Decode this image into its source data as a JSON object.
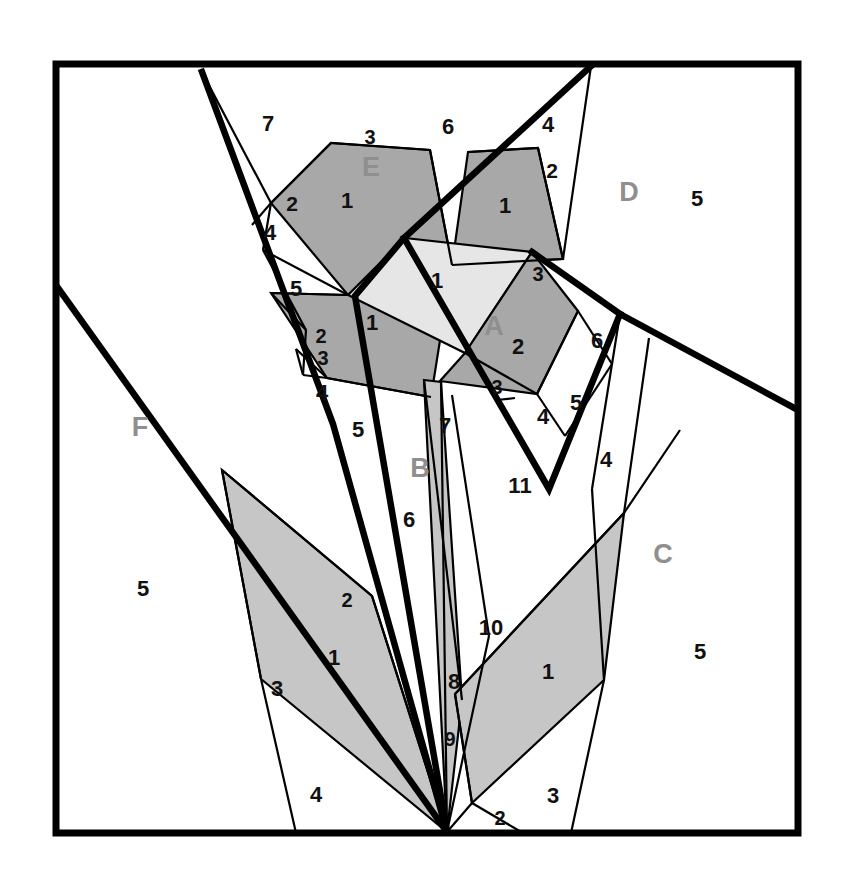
{
  "figure": {
    "frame": {
      "x": 56,
      "y": 64,
      "width": 742,
      "height": 769
    },
    "canvas": {
      "width": 845,
      "height": 878
    }
  },
  "colors": {
    "background": "#ffffff",
    "stroke": "#000000",
    "dark_gray": "#a8a8a8",
    "mid_gray": "#c6c6c6",
    "light_gray": "#e6e6e6",
    "white_piece": "#ffffff",
    "letter_label": "#8f8f8f",
    "number_label": "#111111"
  },
  "group_labels": [
    {
      "id": "A",
      "text": "A",
      "x": 494,
      "y": 328,
      "size": 27
    },
    {
      "id": "B",
      "text": "B",
      "x": 420,
      "y": 470,
      "size": 27
    },
    {
      "id": "C",
      "text": "C",
      "x": 663,
      "y": 556,
      "size": 27
    },
    {
      "id": "D",
      "text": "D",
      "x": 629,
      "y": 194,
      "size": 27
    },
    {
      "id": "E",
      "text": "E",
      "x": 371,
      "y": 169,
      "size": 27
    },
    {
      "id": "F",
      "text": "F",
      "x": 140,
      "y": 429,
      "size": 27
    }
  ],
  "piece_labels": [
    {
      "id": "e1",
      "text": "1",
      "x": 347,
      "y": 202,
      "size": 22
    },
    {
      "id": "e2",
      "text": "2",
      "x": 292,
      "y": 205,
      "size": 21
    },
    {
      "id": "e3",
      "text": "3",
      "x": 370,
      "y": 139,
      "size": 20
    },
    {
      "id": "e4",
      "text": "4",
      "x": 270,
      "y": 234,
      "size": 22
    },
    {
      "id": "e5",
      "text": "5",
      "x": 296,
      "y": 290,
      "size": 22
    },
    {
      "id": "e6",
      "text": "6",
      "x": 448,
      "y": 128,
      "size": 22
    },
    {
      "id": "e7",
      "text": "7",
      "x": 268,
      "y": 125,
      "size": 22
    },
    {
      "id": "d1",
      "text": "1",
      "x": 505,
      "y": 207,
      "size": 22
    },
    {
      "id": "d2",
      "text": "2",
      "x": 552,
      "y": 172,
      "size": 21
    },
    {
      "id": "d3",
      "text": "3",
      "x": 538,
      "y": 276,
      "size": 20
    },
    {
      "id": "d4",
      "text": "4",
      "x": 548,
      "y": 126,
      "size": 22
    },
    {
      "id": "d5",
      "text": "5",
      "x": 697,
      "y": 200,
      "size": 22
    },
    {
      "id": "c1",
      "text": "1",
      "x": 437,
      "y": 282,
      "size": 22
    },
    {
      "id": "c2",
      "text": "1",
      "x": 372,
      "y": 324,
      "size": 22
    },
    {
      "id": "c3",
      "text": "2",
      "x": 321,
      "y": 338,
      "size": 20
    },
    {
      "id": "c4",
      "text": "3",
      "x": 323,
      "y": 360,
      "size": 20
    },
    {
      "id": "c5",
      "text": "4",
      "x": 322,
      "y": 394,
      "size": 22
    },
    {
      "id": "c6",
      "text": "5",
      "x": 358,
      "y": 431,
      "size": 22
    },
    {
      "id": "a2",
      "text": "2",
      "x": 518,
      "y": 348,
      "size": 22
    },
    {
      "id": "a3",
      "text": "3",
      "x": 497,
      "y": 389,
      "size": 20
    },
    {
      "id": "a4",
      "text": "4",
      "x": 543,
      "y": 418,
      "size": 22
    },
    {
      "id": "a5",
      "text": "5",
      "x": 576,
      "y": 404,
      "size": 22
    },
    {
      "id": "a6",
      "text": "6",
      "x": 597,
      "y": 342,
      "size": 22
    },
    {
      "id": "a4b",
      "text": "4",
      "x": 606,
      "y": 461,
      "size": 22
    },
    {
      "id": "b7",
      "text": "7",
      "x": 445,
      "y": 427,
      "size": 22
    },
    {
      "id": "b6",
      "text": "6",
      "x": 409,
      "y": 521,
      "size": 22
    },
    {
      "id": "b11",
      "text": "11",
      "x": 520,
      "y": 487,
      "size": 22
    },
    {
      "id": "b10",
      "text": "10",
      "x": 491,
      "y": 629,
      "size": 22
    },
    {
      "id": "b8",
      "text": "8",
      "x": 454,
      "y": 683,
      "size": 22
    },
    {
      "id": "b9",
      "text": "9",
      "x": 450,
      "y": 741,
      "size": 20
    },
    {
      "id": "f5",
      "text": "5",
      "x": 143,
      "y": 590,
      "size": 22
    },
    {
      "id": "f1",
      "text": "1",
      "x": 334,
      "y": 659,
      "size": 22
    },
    {
      "id": "f2",
      "text": "2",
      "x": 347,
      "y": 602,
      "size": 20
    },
    {
      "id": "f3",
      "text": "3",
      "x": 277,
      "y": 690,
      "size": 22
    },
    {
      "id": "f4",
      "text": "4",
      "x": 316,
      "y": 796,
      "size": 22
    },
    {
      "id": "cc1",
      "text": "1",
      "x": 548,
      "y": 673,
      "size": 22
    },
    {
      "id": "cc2",
      "text": "2",
      "x": 500,
      "y": 820,
      "size": 20
    },
    {
      "id": "cc3",
      "text": "3",
      "x": 553,
      "y": 797,
      "size": 22
    },
    {
      "id": "cc5",
      "text": "5",
      "x": 700,
      "y": 653,
      "size": 22
    }
  ],
  "shaded_pieces": [
    {
      "id": "E-1",
      "tone": "dark_gray",
      "points": "271,203 331,143 430,150 452,265 348,295"
    },
    {
      "id": "E-central-1",
      "tone": "dark_gray",
      "points": "271,293 348,295 452,265 431,397 327,378"
    },
    {
      "id": "D-1",
      "tone": "dark_gray",
      "points": "452,265 468,152 538,148 563,259"
    },
    {
      "id": "center-1",
      "tone": "light_gray",
      "points": "405,238 532,252 465,353 348,295"
    },
    {
      "id": "A-2",
      "tone": "dark_gray",
      "points": "465,353 532,252 578,311 537,394 440,381"
    },
    {
      "id": "B-sliver-7",
      "tone": "mid_gray",
      "points": "424,380 441,382 462,700 447,832"
    },
    {
      "id": "F-1",
      "tone": "mid_gray",
      "points": "222,470 372,596 447,832 261,679"
    },
    {
      "id": "C-1",
      "tone": "mid_gray",
      "points": "624,513 604,680 472,803 455,694"
    }
  ],
  "thick_lines": [
    {
      "id": "tl-left-main",
      "points": "202,72 333,424 447,832"
    },
    {
      "id": "tl-right-main",
      "points": "591,66 404,238 355,296 447,832"
    },
    {
      "id": "tl-diag-right",
      "points": "532,252 620,314 798,410"
    },
    {
      "id": "tl-lower-right",
      "points": "404,238 549,489 620,314"
    },
    {
      "id": "tl-F-diag",
      "points": "58,288 447,832"
    }
  ],
  "thin_lines": [
    {
      "id": "ln-1",
      "points": "202,72 271,203"
    },
    {
      "id": "ln-2",
      "points": "271,203 331,143"
    },
    {
      "id": "ln-3",
      "points": "331,143 430,150"
    },
    {
      "id": "ln-4",
      "points": "430,150 452,265"
    },
    {
      "id": "ln-5",
      "points": "348,295 271,293"
    },
    {
      "id": "ln-6",
      "points": "263,250 348,295"
    },
    {
      "id": "ln-7",
      "points": "271,203 252,225"
    },
    {
      "id": "ln-8",
      "points": "263,250 271,203"
    },
    {
      "id": "ln-9",
      "points": "296,349 327,378"
    },
    {
      "id": "ln-10",
      "points": "306,330 271,293"
    },
    {
      "id": "ln-11",
      "points": "303,375 327,378"
    },
    {
      "id": "ln-12",
      "points": "327,378 431,397"
    },
    {
      "id": "ln-13",
      "points": "468,152 538,148"
    },
    {
      "id": "ln-14",
      "points": "538,148 563,259"
    },
    {
      "id": "ln-15",
      "points": "591,66 563,259"
    },
    {
      "id": "ln-16",
      "points": "452,265 563,259"
    },
    {
      "id": "ln-17",
      "points": "578,311 537,394"
    },
    {
      "id": "ln-18",
      "points": "537,394 465,353"
    },
    {
      "id": "ln-19",
      "points": "578,311 612,364"
    },
    {
      "id": "ln-20",
      "points": "537,394 565,436"
    },
    {
      "id": "ln-21",
      "points": "612,364 565,436"
    },
    {
      "id": "ln-22",
      "points": "620,314 592,489"
    },
    {
      "id": "ln-23",
      "points": "649,338 624,513"
    },
    {
      "id": "ln-24",
      "points": "497,400 515,398"
    },
    {
      "id": "ln-25",
      "points": "424,380 462,700"
    },
    {
      "id": "ln-26",
      "points": "441,382 447,832"
    },
    {
      "id": "ln-27",
      "points": "404,238 405,238"
    },
    {
      "id": "ln-28",
      "points": "452,395 489,636"
    },
    {
      "id": "ln-29",
      "points": "489,636 447,832"
    },
    {
      "id": "ln-30",
      "points": "222,470 261,679"
    },
    {
      "id": "ln-31",
      "points": "261,679 296,833"
    },
    {
      "id": "ln-32",
      "points": "222,470 372,596"
    },
    {
      "id": "ln-33",
      "points": "372,596 447,832"
    },
    {
      "id": "ln-34",
      "points": "455,694 624,513"
    },
    {
      "id": "ln-35",
      "points": "624,513 680,430"
    },
    {
      "id": "ln-36",
      "points": "604,680 571,833"
    },
    {
      "id": "ln-37",
      "points": "472,803 523,833"
    },
    {
      "id": "ln-38",
      "points": "455,694 472,803"
    },
    {
      "id": "ln-39",
      "points": "447,832 472,803"
    },
    {
      "id": "ln-40",
      "points": "592,489 604,680"
    },
    {
      "id": "ln-41",
      "points": "263,250 306,330"
    },
    {
      "id": "ln-42",
      "points": "306,330 303,375"
    },
    {
      "id": "ln-43",
      "points": "303,375 296,349"
    }
  ]
}
